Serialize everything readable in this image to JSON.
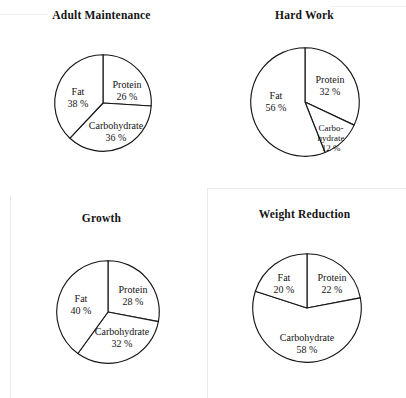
{
  "figure": {
    "background_color": "#ffffff",
    "line_color": "#171717"
  },
  "chart_data": [
    {
      "type": "pie",
      "title": "Adult Maintenance",
      "categories": [
        "Protein",
        "Carbohydrate",
        "Fat"
      ],
      "values": [
        26,
        36,
        38
      ],
      "unit": "%",
      "start_angle": 0,
      "direction": "clockwise",
      "labels": [
        {
          "name": "Protein",
          "pct": "26 %"
        },
        {
          "name": "Carbohydrate",
          "pct": "36 %"
        },
        {
          "name": "Fat",
          "pct": "38 %"
        }
      ]
    },
    {
      "type": "pie",
      "title": "Hard Work",
      "categories": [
        "Protein",
        "Carbohydrate",
        "Fat"
      ],
      "values": [
        32,
        12,
        56
      ],
      "unit": "%",
      "start_angle": 0,
      "direction": "clockwise",
      "labels": [
        {
          "name": "Protein",
          "pct": "32 %"
        },
        {
          "name": "Carbo-",
          "name2": "hydrate",
          "pct": "12 %"
        },
        {
          "name": "Fat",
          "pct": "56 %"
        }
      ]
    },
    {
      "type": "pie",
      "title": "Growth",
      "categories": [
        "Protein",
        "Carbohydrate",
        "Fat"
      ],
      "values": [
        28,
        32,
        40
      ],
      "unit": "%",
      "start_angle": 0,
      "direction": "clockwise",
      "labels": [
        {
          "name": "Protein",
          "pct": "28 %"
        },
        {
          "name": "Carbohydrate",
          "pct": "32 %"
        },
        {
          "name": "Fat",
          "pct": "40 %"
        }
      ]
    },
    {
      "type": "pie",
      "title": "Weight Reduction",
      "categories": [
        "Protein",
        "Carbohydrate",
        "Fat"
      ],
      "values": [
        22,
        58,
        20
      ],
      "unit": "%",
      "start_angle": 0,
      "direction": "clockwise",
      "labels": [
        {
          "name": "Protein",
          "pct": "22 %"
        },
        {
          "name": "Carbohydrate",
          "pct": "58 %"
        },
        {
          "name": "Fat",
          "pct": "20 %"
        }
      ]
    }
  ]
}
